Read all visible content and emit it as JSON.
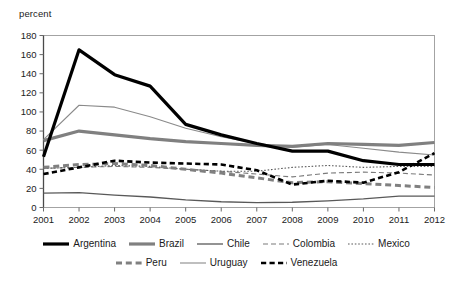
{
  "chart_data": {
    "type": "line",
    "title": "",
    "subtitle": "",
    "xlabel": "",
    "ylabel": "percent",
    "ylim": [
      0,
      180
    ],
    "ytick_step": 20,
    "yticks": [
      0,
      20,
      40,
      60,
      80,
      100,
      120,
      140,
      160,
      180
    ],
    "grid": false,
    "legend_position": "bottom",
    "categories": [
      "2001",
      "2002",
      "2003",
      "2004",
      "2005",
      "2006",
      "2007",
      "2008",
      "2009",
      "2010",
      "2011",
      "2012"
    ],
    "x": [
      2001,
      2002,
      2003,
      2004,
      2005,
      2006,
      2007,
      2008,
      2009,
      2010,
      2011,
      2012
    ],
    "series": [
      {
        "name": "Argentina",
        "color": "#000000",
        "width": 3.2,
        "dash": "none",
        "values": [
          53,
          165,
          139,
          127,
          87,
          76,
          67,
          59,
          59,
          49,
          45,
          45
        ]
      },
      {
        "name": "Brazil",
        "color": "#808080",
        "width": 3.2,
        "dash": "none",
        "values": [
          70,
          80,
          76,
          72,
          69,
          67,
          65,
          64,
          67,
          66,
          65,
          68
        ]
      },
      {
        "name": "Chile",
        "color": "#595959",
        "width": 1.3,
        "dash": "none",
        "values": [
          15,
          15.5,
          13,
          11,
          8,
          6,
          5,
          5.5,
          7,
          9,
          12,
          12
        ]
      },
      {
        "name": "Colombia",
        "color": "#7a7a7a",
        "width": 1.1,
        "dash": "dashed-long",
        "values": [
          41,
          42,
          43,
          42,
          40,
          38,
          35,
          32,
          36,
          37,
          36,
          34
        ]
      },
      {
        "name": "Mexico",
        "color": "#5a5a5a",
        "width": 1.1,
        "dash": "dotted",
        "values": [
          41,
          42,
          44,
          43,
          40,
          38,
          38,
          42,
          44,
          42,
          43,
          43
        ]
      },
      {
        "name": "Peru",
        "color": "#808080",
        "width": 3.0,
        "dash": "dashed",
        "values": [
          42,
          45,
          46,
          44,
          40,
          36,
          31,
          26,
          27,
          25,
          23,
          21
        ]
      },
      {
        "name": "Uruguay",
        "color": "#8a8a8a",
        "width": 1.1,
        "dash": "none",
        "values": [
          71,
          107,
          105,
          95,
          83,
          74,
          67,
          63,
          66,
          62,
          58,
          55
        ]
      },
      {
        "name": "Venezuela",
        "color": "#000000",
        "width": 2.6,
        "dash": "dashed",
        "values": [
          35,
          42,
          49,
          47,
          46,
          45,
          39,
          24,
          28,
          26,
          37,
          57
        ]
      }
    ]
  },
  "legend": {
    "row1": [
      {
        "label": "Argentina",
        "key": "Argentina"
      },
      {
        "label": "Brazil",
        "key": "Brazil"
      },
      {
        "label": "Chile",
        "key": "Chile"
      },
      {
        "label": "Colombia",
        "key": "Colombia"
      },
      {
        "label": "Mexico",
        "key": "Mexico"
      }
    ],
    "row2": [
      {
        "label": "Peru",
        "key": "Peru"
      },
      {
        "label": "Uruguay",
        "key": "Uruguay"
      },
      {
        "label": "Venezuela",
        "key": "Venezuela"
      }
    ]
  },
  "axis_title": {
    "y": "percent"
  }
}
